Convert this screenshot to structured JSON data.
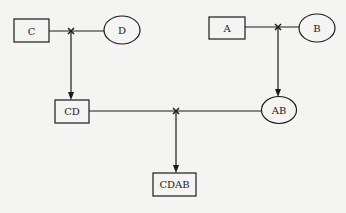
{
  "diagram": {
    "nodes": [
      {
        "id": "C",
        "label": "C",
        "shape": "rect"
      },
      {
        "id": "D",
        "label": "D",
        "shape": "ellipse"
      },
      {
        "id": "A",
        "label": "A",
        "shape": "rect"
      },
      {
        "id": "B",
        "label": "B",
        "shape": "ellipse"
      },
      {
        "id": "CD",
        "label": "CD",
        "shape": "rect"
      },
      {
        "id": "AB",
        "label": "AB",
        "shape": "ellipse"
      },
      {
        "id": "CDAB",
        "label": "CDAB",
        "shape": "rect"
      }
    ],
    "joins": [
      {
        "inputs": [
          "C",
          "D"
        ],
        "output": "CD"
      },
      {
        "inputs": [
          "A",
          "B"
        ],
        "output": "AB"
      },
      {
        "inputs": [
          "CD",
          "AB"
        ],
        "output": "CDAB"
      }
    ],
    "colors": {
      "stroke": "#1a1a1a",
      "background": "#f4f4f2"
    }
  }
}
